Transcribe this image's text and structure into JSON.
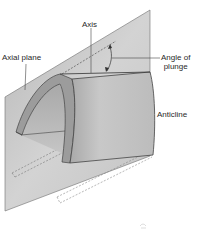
{
  "diagram": {
    "labels": {
      "axis": "Axis",
      "axial_plane": "Axial plane",
      "angle_of_plunge_line1": "Angle of",
      "angle_of_plunge_line2": "plunge",
      "anticline": "Anticline"
    },
    "colors": {
      "background": "#ffffff",
      "plane_fill": "#c9c9c9",
      "plane_edge": "#6e6e6e",
      "fold_surface": "#bdbdbd",
      "fold_edge_band": "#9c9c9c",
      "fold_inner": "#b0b0b0",
      "outline": "#444444",
      "dashed": "#777777",
      "text": "#2a2a2a"
    }
  }
}
